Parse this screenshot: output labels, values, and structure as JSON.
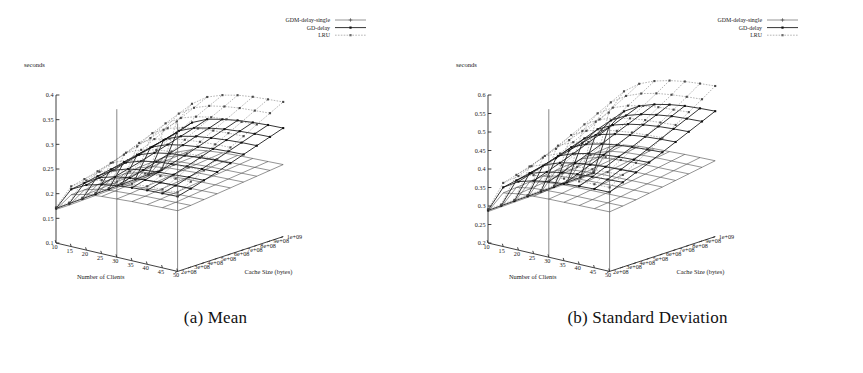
{
  "figure": {
    "panels": [
      {
        "id": "a",
        "caption": "(a) Mean",
        "zlabel": "seconds"
      },
      {
        "id": "b",
        "caption": "(b) Standard Deviation",
        "zlabel": "seconds"
      }
    ],
    "legend": {
      "entries": [
        {
          "label": "GDM-delay-single",
          "marker": "plus",
          "style": "solid-thin",
          "color": "#3a3a3a"
        },
        {
          "label": "GD-delay",
          "marker": "square",
          "style": "solid-thick",
          "color": "#111111"
        },
        {
          "label": "LRU",
          "marker": "square",
          "style": "dotted",
          "color": "#6a6a6a"
        }
      ]
    }
  },
  "chart_data": [
    {
      "type": "line",
      "title": "(a) Mean",
      "subtitle": "",
      "projection": "3d-surface-mesh",
      "zlabel": "seconds",
      "xlabel": "Number of Clients",
      "ylabel": "Cache Size (bytes)",
      "grid": false,
      "legend_position": "top-right",
      "x": [
        10,
        15,
        20,
        25,
        30,
        35,
        40,
        45,
        50
      ],
      "x_ticklabels": [
        "10",
        "15",
        "20",
        "25",
        "30",
        "35",
        "40",
        "45",
        "50"
      ],
      "y": [
        200000000,
        300000000,
        400000000,
        500000000,
        600000000,
        700000000,
        800000000,
        900000000,
        1000000000
      ],
      "y_ticklabels": [
        "2e+08",
        "3e+08",
        "4e+08",
        "5e+08",
        "6e+08",
        "7e+08",
        "8e+08",
        "9e+08",
        "1e+09"
      ],
      "zlim": [
        0.1,
        0.4
      ],
      "z_ticklabels": [
        "0.1",
        "0.15",
        "0.2",
        "0.25",
        "0.3",
        "0.35",
        "0.4"
      ],
      "z_ticks": [
        0.1,
        0.15,
        0.2,
        0.25,
        0.3,
        0.35,
        0.4
      ],
      "series": [
        {
          "name": "GDM-delay-single",
          "z": [
            [
              0.168,
              0.205,
              0.213,
              0.216,
              0.218,
              0.22,
              0.221,
              0.222,
              0.223
            ],
            [
              0.168,
              0.206,
              0.215,
              0.218,
              0.22,
              0.222,
              0.223,
              0.224,
              0.225
            ],
            [
              0.169,
              0.208,
              0.217,
              0.221,
              0.223,
              0.225,
              0.226,
              0.227,
              0.228
            ],
            [
              0.17,
              0.21,
              0.22,
              0.224,
              0.226,
              0.228,
              0.229,
              0.23,
              0.231
            ],
            [
              0.171,
              0.212,
              0.222,
              0.227,
              0.229,
              0.231,
              0.232,
              0.233,
              0.234
            ],
            [
              0.172,
              0.215,
              0.225,
              0.23,
              0.232,
              0.234,
              0.235,
              0.236,
              0.237
            ],
            [
              0.173,
              0.217,
              0.228,
              0.233,
              0.235,
              0.237,
              0.238,
              0.239,
              0.24
            ],
            [
              0.174,
              0.219,
              0.23,
              0.235,
              0.238,
              0.24,
              0.241,
              0.242,
              0.243
            ],
            [
              0.175,
              0.221,
              0.233,
              0.238,
              0.241,
              0.243,
              0.244,
              0.245,
              0.246
            ]
          ]
        },
        {
          "name": "GD-delay",
          "z": [
            [
              0.17,
              0.216,
              0.232,
              0.24,
              0.245,
              0.248,
              0.25,
              0.251,
              0.252
            ],
            [
              0.171,
              0.22,
              0.238,
              0.247,
              0.252,
              0.255,
              0.257,
              0.258,
              0.259
            ],
            [
              0.172,
              0.225,
              0.244,
              0.254,
              0.259,
              0.262,
              0.264,
              0.266,
              0.267
            ],
            [
              0.173,
              0.23,
              0.251,
              0.261,
              0.267,
              0.27,
              0.272,
              0.274,
              0.275
            ],
            [
              0.174,
              0.236,
              0.258,
              0.269,
              0.275,
              0.278,
              0.281,
              0.283,
              0.284
            ],
            [
              0.175,
              0.242,
              0.265,
              0.277,
              0.283,
              0.287,
              0.29,
              0.292,
              0.293
            ],
            [
              0.176,
              0.248,
              0.272,
              0.285,
              0.292,
              0.296,
              0.299,
              0.301,
              0.302
            ],
            [
              0.177,
              0.254,
              0.28,
              0.293,
              0.3,
              0.305,
              0.308,
              0.31,
              0.311
            ],
            [
              0.178,
              0.26,
              0.288,
              0.302,
              0.309,
              0.314,
              0.317,
              0.319,
              0.32
            ]
          ]
        },
        {
          "name": "LRU",
          "z": [
            [
              0.172,
              0.222,
              0.241,
              0.249,
              0.253,
              0.256,
              0.258,
              0.259,
              0.26
            ],
            [
              0.173,
              0.228,
              0.25,
              0.26,
              0.265,
              0.268,
              0.27,
              0.272,
              0.273
            ],
            [
              0.174,
              0.235,
              0.26,
              0.272,
              0.278,
              0.282,
              0.284,
              0.286,
              0.287
            ],
            [
              0.175,
              0.243,
              0.271,
              0.284,
              0.291,
              0.295,
              0.298,
              0.3,
              0.301
            ],
            [
              0.176,
              0.251,
              0.282,
              0.297,
              0.305,
              0.31,
              0.313,
              0.315,
              0.316
            ],
            [
              0.177,
              0.259,
              0.293,
              0.31,
              0.318,
              0.324,
              0.327,
              0.329,
              0.33
            ],
            [
              0.178,
              0.267,
              0.304,
              0.322,
              0.332,
              0.338,
              0.341,
              0.343,
              0.345
            ],
            [
              0.179,
              0.275,
              0.315,
              0.334,
              0.345,
              0.351,
              0.355,
              0.357,
              0.359
            ],
            [
              0.18,
              0.283,
              0.326,
              0.347,
              0.358,
              0.365,
              0.369,
              0.371,
              0.373
            ]
          ]
        }
      ]
    },
    {
      "type": "line",
      "title": "(b) Standard Deviation",
      "subtitle": "",
      "projection": "3d-surface-mesh",
      "zlabel": "seconds",
      "xlabel": "Number of Clients",
      "ylabel": "Cache Size (bytes)",
      "grid": false,
      "legend_position": "top-right",
      "x": [
        10,
        15,
        20,
        25,
        30,
        35,
        40,
        45,
        50
      ],
      "x_ticklabels": [
        "10",
        "15",
        "20",
        "25",
        "30",
        "35",
        "40",
        "45",
        "50"
      ],
      "y": [
        200000000,
        300000000,
        400000000,
        500000000,
        600000000,
        700000000,
        800000000,
        900000000,
        1000000000
      ],
      "y_ticklabels": [
        "2e+08",
        "3e+08",
        "4e+08",
        "5e+08",
        "6e+08",
        "7e+08",
        "8e+08",
        "9e+08",
        "1e+09"
      ],
      "zlim": [
        0.2,
        0.6
      ],
      "z_ticklabels": [
        "0.2",
        "0.25",
        "0.3",
        "0.35",
        "0.4",
        "0.45",
        "0.5",
        "0.55",
        "0.6"
      ],
      "z_ticks": [
        0.2,
        0.25,
        0.3,
        0.35,
        0.4,
        0.45,
        0.5,
        0.55,
        0.6
      ],
      "series": [
        {
          "name": "GDM-delay-single",
          "z": [
            [
              0.285,
              0.345,
              0.352,
              0.355,
              0.357,
              0.358,
              0.359,
              0.36,
              0.361
            ],
            [
              0.286,
              0.348,
              0.356,
              0.359,
              0.361,
              0.362,
              0.363,
              0.364,
              0.365
            ],
            [
              0.287,
              0.351,
              0.36,
              0.364,
              0.366,
              0.367,
              0.368,
              0.369,
              0.37
            ],
            [
              0.288,
              0.355,
              0.365,
              0.369,
              0.371,
              0.373,
              0.374,
              0.375,
              0.376
            ],
            [
              0.289,
              0.359,
              0.37,
              0.374,
              0.377,
              0.378,
              0.379,
              0.38,
              0.381
            ],
            [
              0.29,
              0.363,
              0.375,
              0.38,
              0.382,
              0.384,
              0.385,
              0.386,
              0.387
            ],
            [
              0.291,
              0.367,
              0.38,
              0.385,
              0.388,
              0.39,
              0.391,
              0.392,
              0.393
            ],
            [
              0.292,
              0.371,
              0.385,
              0.391,
              0.394,
              0.396,
              0.397,
              0.398,
              0.399
            ],
            [
              0.293,
              0.375,
              0.39,
              0.396,
              0.399,
              0.401,
              0.403,
              0.404,
              0.405
            ]
          ]
        },
        {
          "name": "GD-delay",
          "z": [
            [
              0.288,
              0.36,
              0.385,
              0.397,
              0.404,
              0.408,
              0.411,
              0.413,
              0.414
            ],
            [
              0.289,
              0.367,
              0.396,
              0.409,
              0.417,
              0.422,
              0.425,
              0.427,
              0.429
            ],
            [
              0.29,
              0.375,
              0.407,
              0.422,
              0.431,
              0.436,
              0.44,
              0.442,
              0.444
            ],
            [
              0.291,
              0.383,
              0.419,
              0.435,
              0.445,
              0.451,
              0.455,
              0.457,
              0.459
            ],
            [
              0.292,
              0.392,
              0.431,
              0.449,
              0.459,
              0.466,
              0.47,
              0.473,
              0.475
            ],
            [
              0.293,
              0.401,
              0.443,
              0.463,
              0.474,
              0.481,
              0.486,
              0.489,
              0.491
            ],
            [
              0.294,
              0.41,
              0.456,
              0.477,
              0.489,
              0.497,
              0.502,
              0.505,
              0.507
            ],
            [
              0.295,
              0.419,
              0.468,
              0.491,
              0.504,
              0.512,
              0.518,
              0.521,
              0.523
            ],
            [
              0.296,
              0.428,
              0.481,
              0.505,
              0.519,
              0.528,
              0.534,
              0.537,
              0.539
            ]
          ]
        },
        {
          "name": "LRU",
          "z": [
            [
              0.291,
              0.372,
              0.4,
              0.412,
              0.418,
              0.422,
              0.424,
              0.426,
              0.427
            ],
            [
              0.292,
              0.382,
              0.415,
              0.429,
              0.437,
              0.442,
              0.445,
              0.447,
              0.449
            ],
            [
              0.293,
              0.393,
              0.431,
              0.447,
              0.456,
              0.462,
              0.466,
              0.468,
              0.47
            ],
            [
              0.294,
              0.405,
              0.447,
              0.466,
              0.476,
              0.483,
              0.487,
              0.49,
              0.492
            ],
            [
              0.295,
              0.417,
              0.464,
              0.485,
              0.497,
              0.504,
              0.509,
              0.512,
              0.514
            ],
            [
              0.296,
              0.429,
              0.481,
              0.504,
              0.517,
              0.526,
              0.531,
              0.534,
              0.537
            ],
            [
              0.297,
              0.442,
              0.499,
              0.524,
              0.539,
              0.548,
              0.554,
              0.557,
              0.56
            ],
            [
              0.298,
              0.455,
              0.517,
              0.544,
              0.56,
              0.57,
              0.576,
              0.58,
              0.583
            ],
            [
              0.299,
              0.468,
              0.535,
              0.565,
              0.582,
              0.593,
              0.6,
              0.604,
              0.607
            ]
          ]
        }
      ]
    }
  ]
}
